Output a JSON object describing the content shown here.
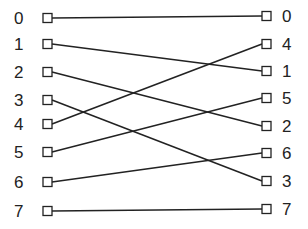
{
  "diagram": {
    "type": "permutation-network",
    "colors": {
      "line": "#222222",
      "node_fill": "#ffffff",
      "background": "#ffffff"
    },
    "left_nodes": [
      {
        "label": "0",
        "y": 18
      },
      {
        "label": "1",
        "y": 44
      },
      {
        "label": "2",
        "y": 72
      },
      {
        "label": "3",
        "y": 100
      },
      {
        "label": "4",
        "y": 124
      },
      {
        "label": "5",
        "y": 152
      },
      {
        "label": "6",
        "y": 182
      },
      {
        "label": "7",
        "y": 211
      }
    ],
    "right_nodes": [
      {
        "label": "0",
        "y": 16
      },
      {
        "label": "4",
        "y": 44
      },
      {
        "label": "1",
        "y": 71
      },
      {
        "label": "5",
        "y": 98
      },
      {
        "label": "2",
        "y": 126
      },
      {
        "label": "6",
        "y": 153
      },
      {
        "label": "3",
        "y": 181
      },
      {
        "label": "7",
        "y": 209
      }
    ],
    "edges": [
      {
        "from": "0",
        "to": "0"
      },
      {
        "from": "1",
        "to": "1"
      },
      {
        "from": "2",
        "to": "2"
      },
      {
        "from": "3",
        "to": "3"
      },
      {
        "from": "4",
        "to": "4"
      },
      {
        "from": "5",
        "to": "5"
      },
      {
        "from": "6",
        "to": "6"
      },
      {
        "from": "7",
        "to": "7"
      }
    ]
  }
}
